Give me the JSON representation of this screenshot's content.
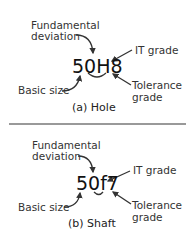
{
  "hole": {
    "code": "50H8",
    "fundamental_line1": "Fundamental",
    "fundamental_line2": "deviation",
    "it_grade": "IT grade",
    "basic_size": "Basic size",
    "tolerance_line1": "Tolerance",
    "tolerance_line2": "grade",
    "caption": "(a) Hole"
  },
  "shaft": {
    "code": "50f7",
    "fundamental_line1": "Fundamental",
    "fundamental_line2": "deviation",
    "it_grade": "IT grade",
    "basic_size": "Basic size",
    "tolerance_line1": "Tolerance",
    "tolerance_line2": "grade",
    "caption": "(b) Shaft"
  }
}
